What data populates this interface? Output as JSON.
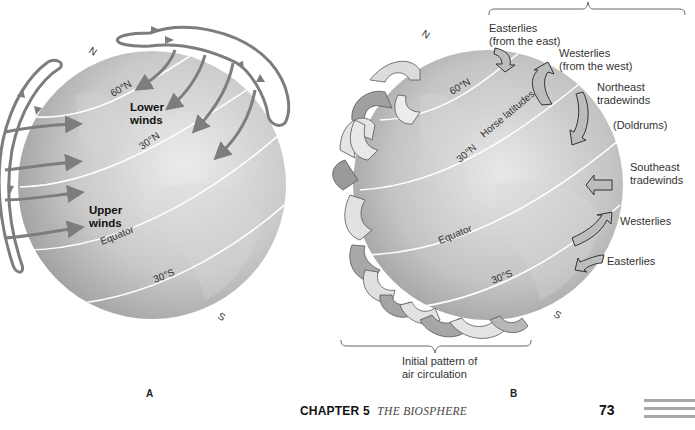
{
  "figure_a": {
    "panel_label": "A",
    "pole_north": "N",
    "pole_south": "S",
    "lat_60n": "60°N",
    "lat_30n": "30°N",
    "equator": "Equator",
    "lat_30s": "30°S",
    "lower_winds": [
      "Lower",
      "winds"
    ],
    "upper_winds": [
      "Upper",
      "winds"
    ]
  },
  "figure_b": {
    "panel_label": "B",
    "pole_north": "N",
    "pole_south": "S",
    "lat_60n": "60°N",
    "lat_30n": "30°N",
    "horse_latitudes": "Horse latitudes",
    "equator": "Equator",
    "lat_30s": "30°S",
    "labels": {
      "easterlies_north": [
        "Easterlies",
        "(from the east)"
      ],
      "westerlies_north": [
        "Westerlies",
        "(from the west)"
      ],
      "ne_tradewinds": [
        "Northeast",
        "tradewinds"
      ],
      "doldrums": "(Doldrums)",
      "se_tradewinds": [
        "Southeast",
        "tradewinds"
      ],
      "westerlies_south": "Westerlies",
      "easterlies_south": "Easterlies"
    },
    "bottom_brace_caption": [
      "Initial pattern of",
      "air circulation"
    ]
  },
  "footer": {
    "chapter": "CHAPTER 5",
    "title": "THE BIOSPHERE",
    "page_number": "73"
  },
  "colors": {
    "globe_light": "#e2e2e2",
    "globe_mid": "#b4b4b4",
    "globe_dark": "#7a7a7a",
    "arrow_gray": "#7d7d7d",
    "latitude_line": "#ffffff",
    "page_rule": "#a8a8a8"
  }
}
